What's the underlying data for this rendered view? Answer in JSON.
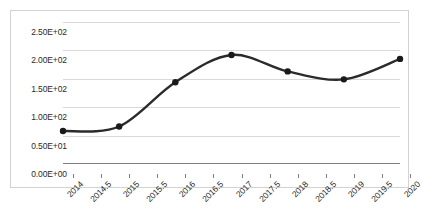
{
  "chart_data": {
    "type": "line",
    "title": "",
    "subtitle": "",
    "xlabel": "",
    "ylabel": "",
    "x": [
      2014,
      2015,
      2016,
      2017,
      2018,
      2019,
      2020
    ],
    "values": [
      58,
      66,
      144,
      192,
      163,
      149,
      185
    ],
    "series": [
      {
        "name": "series-1",
        "x": [
          2014,
          2015,
          2016,
          2017,
          2018,
          2019,
          2020
        ],
        "values": [
          58,
          66,
          144,
          192,
          163,
          149,
          185
        ]
      }
    ],
    "xlim": [
      2014,
      2020
    ],
    "ylim": [
      0,
      250
    ],
    "x_tick_labels": [
      "2014",
      "2014.5",
      "2015",
      "2015.5",
      "2016",
      "2016.5",
      "2017",
      "2017.5",
      "2018",
      "2018.5",
      "2019",
      "2019.5",
      "2020"
    ],
    "x_tick_values": [
      2014,
      2014.5,
      2015,
      2015.5,
      2016,
      2016.5,
      2017,
      2017.5,
      2018,
      2018.5,
      2019,
      2019.5,
      2020
    ],
    "y_tick_labels": [
      "0.00E+00",
      "0.50E+01",
      "1.00E+02",
      "1.50E+02",
      "2.00E+02",
      "2.50E+02"
    ],
    "y_tick_values": [
      0,
      50,
      100,
      150,
      200,
      250
    ],
    "grid": "horizontal",
    "legend": "none",
    "smoothing": "spline",
    "marker": "circle",
    "line_color": "#2b2b2b",
    "marker_color": "#1a1a1a",
    "gridline_color": "#d9d9d9",
    "axis_color": "#808080",
    "border_color": "#d2d2d2",
    "background_color": "#ffffff",
    "annotations": []
  }
}
